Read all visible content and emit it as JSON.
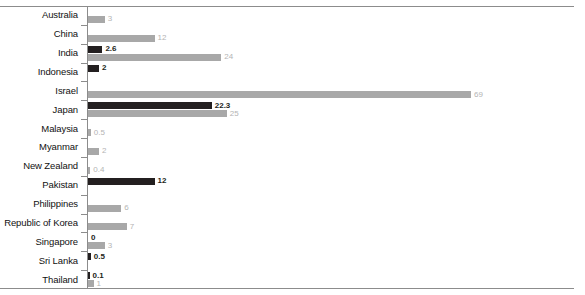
{
  "chart_data": {
    "type": "bar",
    "orientation": "horizontal",
    "title": "",
    "subtitle": "",
    "xlabel": "",
    "ylabel": "",
    "xlim": [
      0,
      80
    ],
    "grid": false,
    "legend": "none",
    "categories": [
      "Australia",
      "China",
      "India",
      "Indonesia",
      "Israel",
      "Japan",
      "Malaysia",
      "Myanmar",
      "New Zealand",
      "Pakistan",
      "Philippines",
      "Republic of Korea",
      "Singapore",
      "Sri Lanka",
      "Thailand"
    ],
    "series": [
      {
        "name": "dark-series",
        "color": "#231f20",
        "values": [
          null,
          null,
          2.6,
          2,
          null,
          22.3,
          null,
          null,
          null,
          12,
          null,
          null,
          0,
          0.5,
          0.1
        ],
        "labels": [
          "",
          "",
          "2.6",
          "2",
          "",
          "22.3",
          "",
          "",
          "",
          "12",
          "",
          "",
          "0",
          "0.5",
          "0.1"
        ]
      },
      {
        "name": "light-series",
        "color": "#a8a8a8",
        "values": [
          3,
          12,
          24,
          null,
          69,
          25,
          0.5,
          2,
          0.4,
          null,
          6,
          7,
          3,
          null,
          1
        ],
        "labels": [
          "3",
          "12",
          "24",
          "",
          "69",
          "25",
          "0.5",
          "2",
          "0.4",
          "",
          "6",
          "7",
          "3",
          "",
          "1"
        ]
      }
    ]
  },
  "colors": {
    "dark_bar": "#231f20",
    "light_bar": "#a8a8a8",
    "dark_label": "#231f20",
    "light_label": "#b4b4b4",
    "axis": "#8c8c8c",
    "category_label": "#111111",
    "background": "#ffffff"
  }
}
